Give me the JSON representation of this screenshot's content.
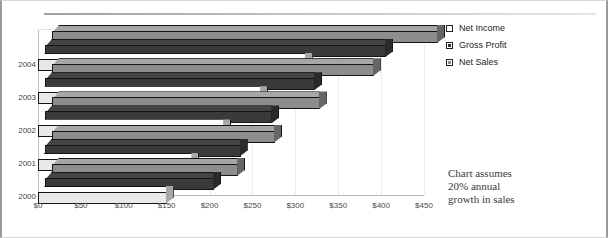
{
  "chart_data": {
    "type": "bar",
    "orientation": "horizontal",
    "style": "3d-stacked-rows",
    "title": "",
    "xlabel": "",
    "ylabel": "",
    "categories": [
      "2000",
      "2001",
      "2002",
      "2003",
      "2004"
    ],
    "series": [
      {
        "name": "Net Income",
        "color": "#e8e8e8",
        "values": [
          150,
          180,
          217,
          260,
          312
        ]
      },
      {
        "name": "Gross Profit",
        "color": "#3a3a3a",
        "values": [
          197,
          228,
          265,
          315,
          398
        ]
      },
      {
        "name": "Net Sales",
        "color": "#8d8d8d",
        "values": [
          217,
          260,
          312,
          375,
          450
        ]
      }
    ],
    "xlim": [
      0,
      450
    ],
    "xticks": [
      0,
      50,
      100,
      150,
      200,
      250,
      300,
      350,
      400,
      450
    ],
    "xticklabels": [
      "$0",
      "$50",
      "$100",
      "$150",
      "$200",
      "$250",
      "$300",
      "$350",
      "$400",
      "$450"
    ],
    "grid": true,
    "legend_position": "right-top",
    "annotation": "Chart assumes 20% annual growth in sales"
  },
  "legend": {
    "items": [
      {
        "label": "Net Income",
        "swatch": "#ffffff"
      },
      {
        "label": "Gross Profit",
        "swatch": "#333333"
      },
      {
        "label": "Net Sales",
        "swatch": "#8d8d8d"
      }
    ]
  },
  "note": {
    "line1": "Chart assumes",
    "line2": "20% annual",
    "line3": "growth in sales"
  },
  "axis": {
    "x_labels": [
      "$0",
      "$50",
      "$100",
      "$150",
      "$200",
      "$250",
      "$300",
      "$350",
      "$400",
      "$450"
    ],
    "y_labels": [
      "2004",
      "2003",
      "2002",
      "2001",
      "2000"
    ]
  }
}
